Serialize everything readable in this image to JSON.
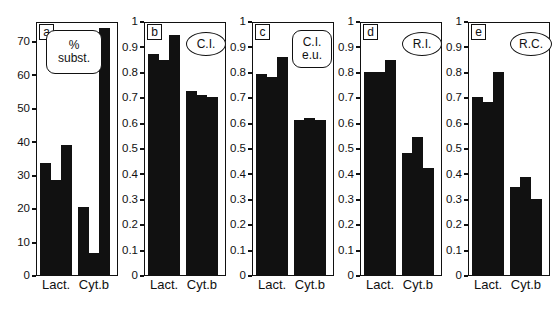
{
  "figure": {
    "background": "#ffffff",
    "bar_color": "#111111",
    "axis_color": "#111111",
    "categories": [
      "Lact.",
      "Cyt.b"
    ]
  },
  "chart_data": [
    {
      "type": "bar",
      "panel": "a",
      "callout": [
        "%",
        "subst."
      ],
      "callout_shape": "round",
      "title": "",
      "xlabel": "",
      "ylabel": "% subst.",
      "ylim": [
        0,
        76
      ],
      "yticks": [
        0,
        10,
        20,
        30,
        40,
        50,
        60,
        70
      ],
      "ytick_labels": [
        "0",
        "10",
        "20",
        "30",
        "40",
        "50",
        "60",
        "70"
      ],
      "grid": false,
      "categories": [
        "Lact.",
        "Cyt.b"
      ],
      "series": [
        {
          "name": "Lact.",
          "values": [
            33.5,
            28.5,
            39.0
          ]
        },
        {
          "name": "Cyt.b",
          "values": [
            20.5,
            6.5,
            74.0
          ]
        }
      ]
    },
    {
      "type": "bar",
      "panel": "b",
      "callout": [
        "C.I."
      ],
      "callout_shape": "oval",
      "title": "",
      "xlabel": "",
      "ylabel": "C.I.",
      "ylim": [
        0,
        1
      ],
      "yticks": [
        0,
        0.1,
        0.2,
        0.3,
        0.4,
        0.5,
        0.6,
        0.7,
        0.8,
        0.9,
        1
      ],
      "ytick_labels": [
        "0",
        "0.1",
        "0.2",
        "0.3",
        "0.4",
        "0.5",
        "0.6",
        "0.7",
        "0.8",
        "0.9",
        "1"
      ],
      "grid": false,
      "categories": [
        "Lact.",
        "Cyt.b"
      ],
      "series": [
        {
          "name": "Lact.",
          "values": [
            0.87,
            0.845,
            0.945
          ]
        },
        {
          "name": "Cyt.b",
          "values": [
            0.725,
            0.71,
            0.7
          ]
        }
      ]
    },
    {
      "type": "bar",
      "panel": "c",
      "callout": [
        "C.I.",
        "e.u."
      ],
      "callout_shape": "round",
      "title": "",
      "xlabel": "",
      "ylabel": "C.I. e.u.",
      "ylim": [
        0,
        1
      ],
      "yticks": [
        0,
        0.1,
        0.2,
        0.3,
        0.4,
        0.5,
        0.6,
        0.7,
        0.8,
        0.9,
        1
      ],
      "ytick_labels": [
        "0",
        "0.1",
        "0.2",
        "0.3",
        "0.4",
        "0.5",
        "0.6",
        "0.7",
        "0.8",
        "0.9",
        "1"
      ],
      "grid": false,
      "categories": [
        "Lact.",
        "Cyt.b"
      ],
      "series": [
        {
          "name": "Lact.",
          "values": [
            0.79,
            0.78,
            0.86
          ]
        },
        {
          "name": "Cyt.b",
          "values": [
            0.61,
            0.62,
            0.61
          ]
        }
      ]
    },
    {
      "type": "bar",
      "panel": "d",
      "callout": [
        "R.I."
      ],
      "callout_shape": "oval",
      "title": "",
      "xlabel": "",
      "ylabel": "R.I.",
      "ylim": [
        0,
        1
      ],
      "yticks": [
        0,
        0.1,
        0.2,
        0.3,
        0.4,
        0.5,
        0.6,
        0.7,
        0.8,
        0.9,
        1
      ],
      "ytick_labels": [
        "0",
        "0.1",
        "0.2",
        "0.3",
        "0.4",
        "0.5",
        "0.6",
        "0.7",
        "0.8",
        "0.9",
        "1"
      ],
      "grid": false,
      "categories": [
        "Lact.",
        "Cyt.b"
      ],
      "series": [
        {
          "name": "Lact.",
          "values": [
            0.8,
            0.8,
            0.845
          ]
        },
        {
          "name": "Cyt.b",
          "values": [
            0.48,
            0.545,
            0.42
          ]
        }
      ]
    },
    {
      "type": "bar",
      "panel": "e",
      "callout": [
        "R.C."
      ],
      "callout_shape": "oval",
      "title": "",
      "xlabel": "",
      "ylabel": "R.C.",
      "ylim": [
        0,
        1
      ],
      "yticks": [
        0,
        0.1,
        0.2,
        0.3,
        0.4,
        0.5,
        0.6,
        0.7,
        0.8,
        0.9,
        1
      ],
      "ytick_labels": [
        "0",
        "0.1",
        "0.2",
        "0.3",
        "0.4",
        "0.5",
        "0.6",
        "0.7",
        "0.8",
        "0.9",
        "1"
      ],
      "grid": false,
      "categories": [
        "Lact.",
        "Cyt.b"
      ],
      "series": [
        {
          "name": "Lact.",
          "values": [
            0.7,
            0.68,
            0.8
          ]
        },
        {
          "name": "Cyt.b",
          "values": [
            0.345,
            0.385,
            0.3
          ]
        }
      ]
    }
  ],
  "layout": {
    "panels": [
      {
        "left": 0,
        "width": 118,
        "axis_w": 34,
        "plot_left": 36,
        "plot_w": 82,
        "callout": {
          "left": 10,
          "top": 8,
          "w": 56,
          "h": 44,
          "fs": 12
        }
      },
      {
        "left": 118,
        "width": 108,
        "axis_w": 26,
        "plot_left": 26,
        "plot_w": 82,
        "callout": {
          "left": 42,
          "top": 10,
          "w": 40,
          "h": 24,
          "fs": 12
        }
      },
      {
        "left": 226,
        "width": 108,
        "axis_w": 26,
        "plot_left": 26,
        "plot_w": 82,
        "callout": {
          "left": 40,
          "top": 8,
          "w": 40,
          "h": 38,
          "fs": 12
        }
      },
      {
        "left": 334,
        "width": 108,
        "axis_w": 26,
        "plot_left": 26,
        "plot_w": 82,
        "callout": {
          "left": 42,
          "top": 10,
          "w": 40,
          "h": 24,
          "fs": 12
        }
      },
      {
        "left": 442,
        "width": 112,
        "axis_w": 26,
        "plot_left": 26,
        "plot_w": 82,
        "callout": {
          "left": 42,
          "top": 10,
          "w": 42,
          "h": 24,
          "fs": 12
        }
      }
    ]
  }
}
